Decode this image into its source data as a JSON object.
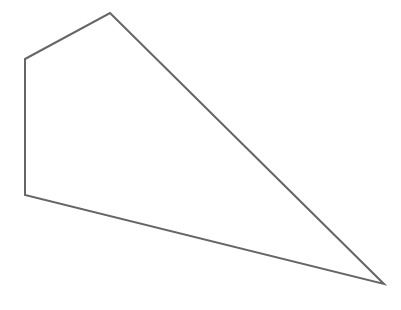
{
  "canvas": {
    "width": 401,
    "height": 310,
    "background": "#ffffff"
  },
  "shape": {
    "type": "polygon",
    "label": "pentagon-outline",
    "points": "25,59 110,13 384,284 25,195",
    "stroke": "#666666",
    "stroke_width": 2,
    "fill": "none"
  }
}
